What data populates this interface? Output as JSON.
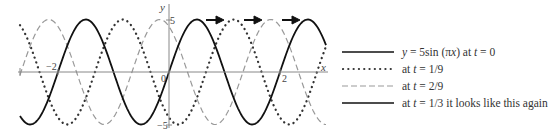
{
  "chart_data": {
    "type": "line",
    "title": "",
    "xlabel": "x",
    "ylabel": "y",
    "xlim": [
      -2.7,
      2.8
    ],
    "ylim": [
      -5,
      5
    ],
    "x_ticks": [
      {
        "value": -2,
        "label": "−2"
      },
      {
        "value": 0,
        "label": "0"
      },
      {
        "value": 2,
        "label": "2"
      }
    ],
    "y_ticks": [
      {
        "value": 5,
        "label": "5"
      },
      {
        "value": -5,
        "label": "−5"
      }
    ],
    "grid": false,
    "legend_position": "right",
    "annotations": [
      "three right-pointing arrows above the curves indicating wave travels in +x direction"
    ],
    "series": [
      {
        "name": "y = 5sin (πx) at t = 0",
        "style": "solid",
        "amplitude": 5,
        "wavenumber": 3.14159,
        "phase_shift_x": 0
      },
      {
        "name": "at t = 1/9",
        "style": "dotted",
        "amplitude": 5,
        "wavenumber": 3.14159,
        "phase_shift_x": 0.6667
      },
      {
        "name": "at t = 2/9",
        "style": "dashed",
        "amplitude": 5,
        "wavenumber": 3.14159,
        "phase_shift_x": 1.3333
      },
      {
        "name": "at t = 1/3 it looks like this again",
        "style": "solid",
        "amplitude": 5,
        "wavenumber": 3.14159,
        "phase_shift_x": 2
      }
    ]
  },
  "axes": {
    "x_label": "x",
    "y_label": "y",
    "x_tick_neg": "−2",
    "x_tick_pos": "2",
    "origin": "0",
    "y_tick_top": "5",
    "y_tick_bottom": "−5"
  },
  "legend": {
    "items": [
      {
        "pre": "y",
        "mid": " = 5sin (π",
        "var": "x",
        "post": ") at ",
        "t": "t",
        "rest": " = 0"
      },
      {
        "pre": "at ",
        "t": "t",
        "rest": " = 1/9"
      },
      {
        "pre": "at ",
        "t": "t",
        "rest": " = 2/9"
      },
      {
        "pre": "at ",
        "t": "t",
        "rest": " = 1/3 it looks like this again"
      }
    ]
  }
}
